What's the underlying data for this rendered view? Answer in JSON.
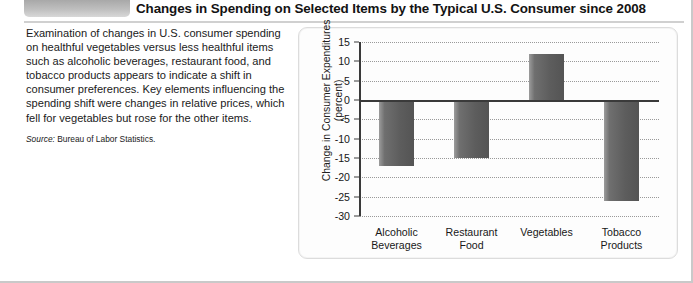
{
  "header": {
    "title": "Changes in Spending on Selected Items by the Typical U.S. Consumer since 2008"
  },
  "blurb": {
    "paragraph": "Examination of changes in U.S. consumer spending on healthful vegetables versus less healthful items such as alcoholic beverages, restaurant food, and tobacco products appears to indicate a shift in consumer preferences. Key elements influencing the spending shift were changes in relative prices, which fell for vegetables but rose for the other items.",
    "source_label": "Source:",
    "source_text": "Bureau of Labor Statistics."
  },
  "chart_data": {
    "type": "bar",
    "title": "",
    "xlabel": "",
    "ylabel": "Change in Consumer Expenditures (percent)",
    "ylabel_line1": "Change in Consumer Expenditures",
    "ylabel_line2": "(percent)",
    "categories": [
      "Alcoholic\nBeverages",
      "Restaurant\nFood",
      "Vegetables",
      "Tobacco\nProducts"
    ],
    "category_lines": [
      [
        "Alcoholic",
        "Beverages"
      ],
      [
        "Restaurant",
        "Food"
      ],
      [
        "Vegetables",
        ""
      ],
      [
        "Tobacco",
        "Products"
      ]
    ],
    "values": [
      -17,
      -15,
      12,
      -26
    ],
    "ylim": [
      -30,
      15
    ],
    "yticks": [
      15,
      10,
      5,
      0,
      -5,
      -10,
      -15,
      -20,
      -25,
      -30
    ],
    "ytick_labels": [
      "15",
      "10",
      "5",
      "0",
      "-5",
      "-10",
      "-15",
      "-20",
      "-25",
      "-30"
    ],
    "grid": true,
    "legend": "none",
    "bar_color": "#5d5d5d",
    "axis_color": "#3a3a3a"
  }
}
